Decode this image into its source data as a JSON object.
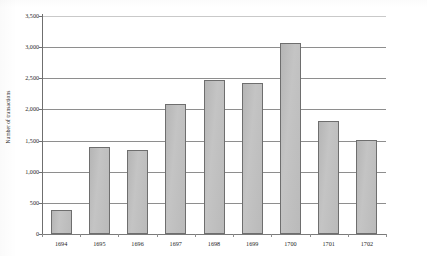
{
  "chart_data": {
    "type": "bar",
    "title": "",
    "xlabel": "",
    "ylabel": "Number of transactions",
    "categories": [
      "1694",
      "1695",
      "1696",
      "1697",
      "1698",
      "1699",
      "1700",
      "1701",
      "1702"
    ],
    "values": [
      380,
      1390,
      1350,
      2080,
      2480,
      2420,
      3070,
      1820,
      1510
    ],
    "ylim": [
      0,
      3500
    ],
    "y_ticks": [
      0,
      500,
      1000,
      1500,
      2000,
      2500,
      3000,
      3500
    ],
    "y_tick_labels": [
      "0",
      "500",
      "1,000",
      "1,500",
      "2,000",
      "2,500",
      "3,000",
      "3,500"
    ],
    "grid": true,
    "legend": "none",
    "series": [
      {
        "name": "Number of transactions",
        "values": [
          380,
          1390,
          1350,
          2080,
          2480,
          2420,
          3070,
          1820,
          1510
        ]
      }
    ],
    "colors": {
      "bar_fill": "#bdbdbd",
      "bar_border": "#6e6e6e",
      "gridline": "#8e8e8e",
      "axis": "#6f6f6f",
      "text": "#1f1f1f",
      "background": "#ffffff"
    }
  }
}
